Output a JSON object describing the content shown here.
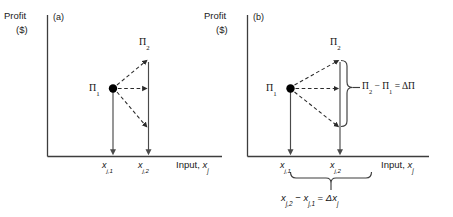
{
  "figure": {
    "type": "line-diagram",
    "panels": [
      {
        "tag": "(a)",
        "y_axis": {
          "line1": "Profit",
          "line2": "($)"
        },
        "x_axis": {
          "label_prefix": "Input, ",
          "label_var": "x",
          "label_sub": "j"
        },
        "points": [
          {
            "name": "pi-1",
            "label_base": "Π",
            "label_sub": "1",
            "x_tick": "x_j,1",
            "profit_level": "low"
          },
          {
            "name": "pi-2",
            "label_base": "Π",
            "label_sub": "2",
            "x_tick": "x_j,2",
            "profit_level": "high"
          }
        ],
        "ticks": [
          {
            "var": "x",
            "sub": "j,1"
          },
          {
            "var": "x",
            "sub": "j,2"
          }
        ],
        "annotations": []
      },
      {
        "tag": "(b)",
        "y_axis": {
          "line1": "Profit",
          "line2": "($)"
        },
        "x_axis": {
          "label_prefix": "Input, ",
          "label_var": "x",
          "label_sub": "j"
        },
        "points": [
          {
            "name": "pi-1",
            "label_base": "Π",
            "label_sub": "1",
            "x_tick": "x_j,1",
            "profit_level": "low"
          },
          {
            "name": "pi-2",
            "label_base": "Π",
            "label_sub": "2",
            "x_tick": "x_j,2",
            "profit_level": "high"
          }
        ],
        "ticks": [
          {
            "var": "x",
            "sub": "j,1"
          },
          {
            "var": "x",
            "sub": "j,2"
          }
        ],
        "annotations": [
          {
            "name": "delta-profit",
            "placement": "right-brace",
            "parts": {
              "a": "Π",
              "a_sub": "2",
              "minus": " − ",
              "b": "Π",
              "b_sub": "1",
              "equals": " = ",
              "result": "ΔΠ"
            }
          },
          {
            "name": "delta-input",
            "placement": "bottom-brace",
            "parts": {
              "a": "x",
              "a_sub": "j,2",
              "minus": " − ",
              "b": "x",
              "b_sub": "j,1",
              "equals": " = ",
              "result_delta": "Δx",
              "result_sub": "j"
            }
          }
        ]
      }
    ],
    "style": {
      "axis_color": "#3d3d3d",
      "solid_arrow_color": "#4a4a4a",
      "dashed_arrow_color": "#2b2b2b",
      "point_color": "#000000",
      "brace_color": "#3d3d3d",
      "background": "#ffffff"
    }
  }
}
